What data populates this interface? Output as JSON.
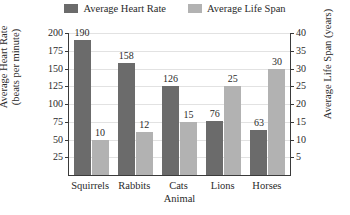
{
  "chart_data": {
    "type": "bar",
    "title": "",
    "categories": [
      "Squirrels",
      "Rabbits",
      "Cats",
      "Lions",
      "Horses"
    ],
    "series": [
      {
        "name": "Average Heart Rate",
        "axis": "left",
        "color": "#6b6b6b",
        "values": [
          190,
          158,
          126,
          76,
          63
        ]
      },
      {
        "name": "Average Life Span",
        "axis": "right",
        "color": "#b2b2b2",
        "values": [
          10,
          12,
          15,
          25,
          30
        ]
      }
    ],
    "xlabel": "Animal",
    "ylabel": "Average Heart Rate (beats per minute)",
    "ylabel_line1": "Average Heart Rate",
    "ylabel_line2": "(beats per minute)",
    "y2label": "Average Life Span (years)",
    "ylim": [
      0,
      200
    ],
    "y2lim": [
      0,
      40
    ],
    "yticks": [
      25,
      50,
      75,
      100,
      125,
      150,
      175,
      200
    ],
    "y2ticks": [
      5,
      10,
      15,
      20,
      25,
      30,
      35,
      40
    ],
    "grid": true,
    "legend_position": "top"
  },
  "legend": {
    "items": [
      {
        "label": "Average Heart Rate",
        "color": "#6b6b6b"
      },
      {
        "label": "Average Life Span",
        "color": "#b2b2b2"
      }
    ]
  }
}
